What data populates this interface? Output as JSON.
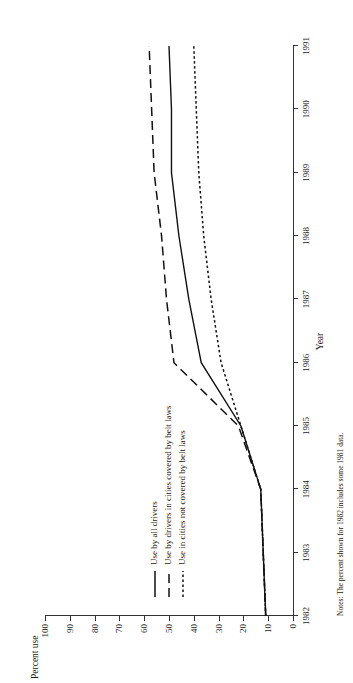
{
  "chart_data": {
    "type": "line",
    "title": "",
    "xlabel": "Year",
    "ylabel": "Percent use",
    "xlim": [
      1982,
      1991
    ],
    "ylim": [
      0,
      100
    ],
    "grid": false,
    "legend_position": "inside-left",
    "x": [
      1982,
      1983,
      1984,
      1985,
      1986,
      1987,
      1988,
      1989,
      1990,
      1991
    ],
    "x_tick_labels": [
      "1982",
      "1983",
      "1984",
      "1985",
      "1986",
      "1987",
      "1988",
      "1989",
      "1990",
      "1991"
    ],
    "y_tick_labels": [
      "0",
      "10",
      "20",
      "30",
      "40",
      "50",
      "60",
      "70",
      "80",
      "90",
      "100"
    ],
    "y_ticks": [
      0,
      10,
      20,
      30,
      40,
      50,
      60,
      70,
      80,
      90,
      100
    ],
    "series": [
      {
        "name": "Use by all drivers",
        "line_style": "solid",
        "values": [
          11,
          12,
          13,
          21,
          37,
          42,
          46,
          49,
          49,
          50
        ]
      },
      {
        "name": "Use by drivers in cities covered by belt laws",
        "line_style": "dashed",
        "values": [
          11,
          12,
          13,
          22,
          48,
          51,
          53,
          56,
          57,
          58
        ]
      },
      {
        "name": "Use in cities not covered by belt laws",
        "line_style": "dotted",
        "values": [
          11,
          12,
          13,
          21,
          29,
          33,
          36,
          38,
          39,
          40
        ]
      }
    ],
    "note": "Notes: The percent shown for 1982 includes some 1981 data."
  },
  "axes": {
    "y_axis_title": "Percent use",
    "x_axis_title": "Year"
  },
  "legend": {
    "items": [
      {
        "label": "Use by all drivers",
        "style": "solid"
      },
      {
        "label": "Use by drivers in cities covered by belt laws",
        "style": "dashed"
      },
      {
        "label": "Use in cities not covered by belt laws",
        "style": "dotted"
      }
    ]
  },
  "note": {
    "text": "Notes: The percent shown for 1982 includes some 1981 data."
  }
}
